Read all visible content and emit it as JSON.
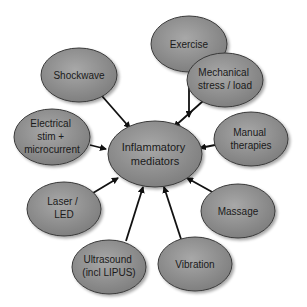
{
  "diagram": {
    "type": "hub-and-spoke",
    "colors": {
      "ellipse_fill_light": "#a3a3a3",
      "ellipse_fill_dark": "#7a7a7a",
      "ellipse_stroke": "#3a3a3a",
      "arrow": "#111111",
      "text": "#1a1a1a",
      "background": "#ffffff"
    },
    "center": {
      "id": "inflammatory-mediators",
      "lines": [
        "Inflammatory",
        "mediators"
      ]
    },
    "nodes": [
      {
        "id": "exercise",
        "lines": [
          "Exercise"
        ]
      },
      {
        "id": "mechanical-stress",
        "lines": [
          "Mechanical",
          "stress / load"
        ]
      },
      {
        "id": "manual-therapies",
        "lines": [
          "Manual",
          "therapies"
        ]
      },
      {
        "id": "massage",
        "lines": [
          "Massage"
        ]
      },
      {
        "id": "vibration",
        "lines": [
          "Vibration"
        ]
      },
      {
        "id": "ultrasound",
        "lines": [
          "Ultrasound",
          "(incl LIPUS)"
        ]
      },
      {
        "id": "laser-led",
        "lines": [
          "Laser /",
          "LED"
        ]
      },
      {
        "id": "electrical-stim",
        "lines": [
          "Electrical",
          "stim +",
          "microcurrent"
        ]
      },
      {
        "id": "shockwave",
        "lines": [
          "Shockwave"
        ]
      }
    ],
    "edges": [
      {
        "from": "exercise",
        "to": "inflammatory-mediators"
      },
      {
        "from": "mechanical-stress",
        "to": "inflammatory-mediators"
      },
      {
        "from": "manual-therapies",
        "to": "inflammatory-mediators"
      },
      {
        "from": "massage",
        "to": "inflammatory-mediators"
      },
      {
        "from": "vibration",
        "to": "inflammatory-mediators"
      },
      {
        "from": "ultrasound",
        "to": "inflammatory-mediators"
      },
      {
        "from": "laser-led",
        "to": "inflammatory-mediators"
      },
      {
        "from": "electrical-stim",
        "to": "inflammatory-mediators"
      },
      {
        "from": "shockwave",
        "to": "inflammatory-mediators"
      }
    ]
  }
}
